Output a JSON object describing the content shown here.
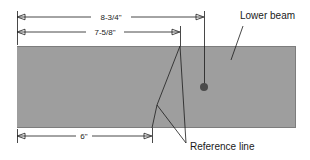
{
  "diagram": {
    "colors": {
      "beam_fill": "#9e9e9e",
      "beam_edge": "#7d7d7d",
      "line": "#1a1a1a",
      "dot": "#4a4a4a",
      "background": "#ffffff"
    },
    "dimensions": [
      {
        "id": "overall",
        "label": "8-3/4\"",
        "x_start": 17,
        "x_end": 204,
        "y": 17
      },
      {
        "id": "intermediate",
        "label": "7-5/8\"",
        "x_start": 17,
        "x_end": 180,
        "y": 32
      },
      {
        "id": "bottom",
        "label": "6\"",
        "x_start": 17,
        "x_end": 152,
        "y": 136
      }
    ],
    "callouts": [
      {
        "id": "lower-beam",
        "label": "Lower beam",
        "text_x": 240,
        "text_y": 16
      },
      {
        "id": "reference-line",
        "label": "Reference line",
        "text_x": 190,
        "text_y": 147
      }
    ],
    "beam": {
      "left": 17,
      "top": 46,
      "right": 296,
      "bottom": 128
    },
    "mark_point": {
      "x": 204,
      "y": 87,
      "radius": 4
    }
  }
}
